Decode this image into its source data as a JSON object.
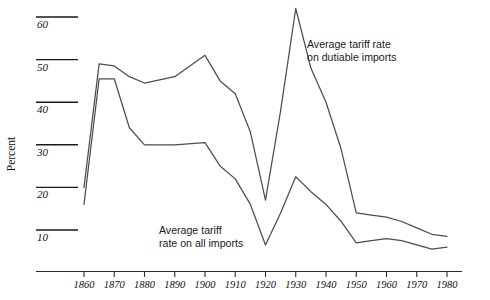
{
  "chart_data": {
    "type": "line",
    "title": "",
    "xlabel": "",
    "ylabel": "Percent",
    "xlim": [
      1855,
      1985
    ],
    "ylim": [
      0,
      65
    ],
    "grid": true,
    "grid_style": "short horizontal tick rules at left",
    "legend": "inline annotations",
    "x_ticks": [
      1860,
      1870,
      1880,
      1890,
      1900,
      1910,
      1920,
      1930,
      1940,
      1950,
      1960,
      1970,
      1980
    ],
    "y_ticks": [
      10,
      20,
      30,
      40,
      50,
      60
    ],
    "x": [
      1860,
      1865,
      1870,
      1875,
      1880,
      1890,
      1900,
      1905,
      1910,
      1915,
      1920,
      1925,
      1930,
      1935,
      1940,
      1945,
      1950,
      1955,
      1960,
      1965,
      1970,
      1975,
      1980
    ],
    "series": [
      {
        "name": "Average tariff rate on dutiable imports",
        "color": "#4d4d4d",
        "values": [
          20,
          49,
          48.5,
          46,
          44.5,
          46,
          51,
          45,
          42,
          33,
          17,
          38,
          62,
          48,
          40,
          29,
          14,
          13.5,
          13,
          12,
          10.5,
          9,
          8.5
        ]
      },
      {
        "name": "Average tariff rate on all imports",
        "color": "#4d4d4d",
        "values": [
          16,
          45.5,
          45.5,
          34,
          30,
          30,
          30.5,
          25,
          22,
          16,
          6.5,
          14,
          22.5,
          19,
          16,
          12,
          7,
          7.5,
          8,
          7.5,
          6.5,
          5.5,
          6
        ]
      }
    ],
    "annotations": [
      {
        "id": "dutiable",
        "lines": [
          "Average tariff rate",
          "on dutiable imports"
        ]
      },
      {
        "id": "all",
        "lines": [
          "Average tariff",
          "rate on all imports"
        ]
      }
    ]
  },
  "axis": {
    "y_label": "Percent",
    "y_ticks": [
      "10",
      "20",
      "30",
      "40",
      "50",
      "60"
    ],
    "x_ticks": [
      "1860",
      "1870",
      "1880",
      "1890",
      "1900",
      "1910",
      "1920",
      "1930",
      "1940",
      "1950",
      "1960",
      "1970",
      "1980"
    ]
  },
  "annotations": {
    "dutiable_line1": "Average tariff rate",
    "dutiable_line2": "on dutiable imports",
    "all_line1": "Average tariff",
    "all_line2": "rate on all imports"
  },
  "colors": {
    "line": "#4d4d4d",
    "axis": "#1a1a1a",
    "background": "#ffffff"
  }
}
